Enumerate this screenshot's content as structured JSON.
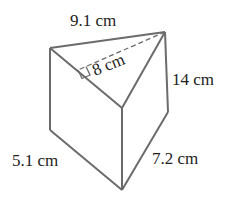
{
  "diagram": {
    "type": "triangular-prism",
    "labels": {
      "top_edge": "9.1 cm",
      "height_of_triangle": "8 cm",
      "prism_length": "14 cm",
      "left_side": "5.1 cm",
      "right_side": "7.2 cm"
    },
    "colors": {
      "edge": "#6b6b6b",
      "text": "#222222"
    }
  }
}
